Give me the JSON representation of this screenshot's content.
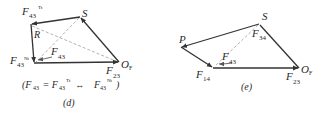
{
  "figure": {
    "panels": [
      {
        "id": "d",
        "caption": "(d)",
        "labels": {
          "f43_tt_main": "F",
          "f43_tt_sub": "43",
          "f43_tt_sup": "Tt",
          "s": "S",
          "r": "R",
          "f43_nt_main": "F",
          "f43_nt_sub": "43",
          "f43_nt_sup": "Nt",
          "f43_main": "F",
          "f43_sub": "43",
          "of_main": "O",
          "of_sub": "F",
          "f23_main": "F",
          "f23_sub": "23"
        },
        "equation": {
          "open": "(F",
          "s1": "43",
          "eq": " = F",
          "s2": "43",
          "sup2": "Tt",
          "arrow": " ↔ ",
          "f3": "F",
          "s3": "43",
          "sup3": "Nt",
          "close": ")"
        }
      },
      {
        "id": "e",
        "caption": "(e)",
        "labels": {
          "p": "P",
          "s": "S",
          "f34_main": "F",
          "f34_sub": "34",
          "f43_main": "F",
          "f43_sub": "43",
          "f14_main": "F",
          "f14_sub": "14",
          "of_main": "O",
          "of_sub": "F",
          "f23_main": "F",
          "f23_sub": "23"
        }
      }
    ],
    "colors": {
      "line": "#333333",
      "dashed": "#9a9a9a",
      "text": "#2a2a2a"
    }
  }
}
